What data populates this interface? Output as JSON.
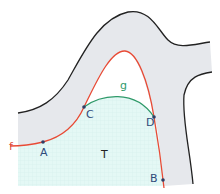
{
  "diagram": {
    "labels": {
      "f": "f",
      "g": "g",
      "A": "A",
      "B": "B",
      "C": "C",
      "D": "D",
      "T": "T"
    },
    "colors": {
      "band_fill": "#e6e8ec",
      "region_T_fill": "#e2f7f4",
      "grid": "#cdeeea",
      "curve_f": "#e84a35",
      "curve_g": "#2f9a6a",
      "outline": "#222222",
      "points": "#2f3f66",
      "label_text": "#2f4a7a"
    },
    "points": [
      {
        "name": "A",
        "x": 43,
        "y": 142
      },
      {
        "name": "C",
        "x": 84,
        "y": 107
      },
      {
        "name": "D",
        "x": 154,
        "y": 117
      },
      {
        "name": "B",
        "x": 163,
        "y": 180
      }
    ]
  }
}
